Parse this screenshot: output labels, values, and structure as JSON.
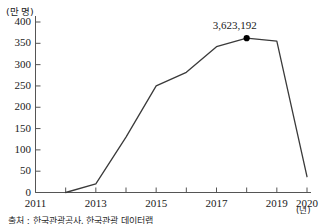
{
  "chart_data": {
    "type": "line",
    "title": "",
    "xlabel": "(년)",
    "ylabel": "(만 명)",
    "x": [
      2011,
      2012,
      2013,
      2014,
      2015,
      2016,
      2017,
      2018,
      2019,
      2020
    ],
    "values": [
      null,
      0,
      20,
      130,
      250,
      282,
      342,
      362,
      355,
      37
    ],
    "xlim": [
      2011,
      2020
    ],
    "ylim": [
      0,
      400
    ],
    "y_ticks": [
      "0",
      "50",
      "100",
      "150",
      "200",
      "250",
      "300",
      "350",
      "400"
    ],
    "y_tick_values": [
      0,
      50,
      100,
      150,
      200,
      250,
      300,
      350,
      400
    ],
    "x_ticks": [
      "2011",
      "2013",
      "2015",
      "2017",
      "2019",
      "2020"
    ],
    "x_tick_values": [
      2011,
      2013,
      2015,
      2017,
      2019,
      2020
    ],
    "grid": false,
    "legend": false,
    "annotations": [
      {
        "label": "3,623,192",
        "x": 2018,
        "y": 362,
        "marker": "dot"
      }
    ],
    "series": [
      {
        "name": "",
        "points": [
          {
            "x": 2012,
            "y": 0
          },
          {
            "x": 2013,
            "y": 20
          },
          {
            "x": 2014,
            "y": 130
          },
          {
            "x": 2015,
            "y": 250
          },
          {
            "x": 2016,
            "y": 282
          },
          {
            "x": 2017,
            "y": 342
          },
          {
            "x": 2018,
            "y": 362
          },
          {
            "x": 2019,
            "y": 355
          },
          {
            "x": 2020,
            "y": 37
          }
        ]
      }
    ],
    "line_color": "#3a3a3a",
    "marker_color": "#000000",
    "axis_color": "#555555",
    "background": "#ffffff"
  },
  "caption": {
    "text": "출처 : 한국관광공사, 한국관광 데이터랩 "
  }
}
